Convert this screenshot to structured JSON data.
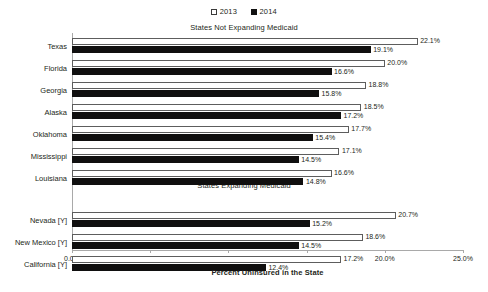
{
  "legend": {
    "position": "top-center",
    "entries": [
      {
        "label": "2013",
        "style": "open",
        "color": "#ffffff"
      },
      {
        "label": "2014",
        "style": "filled",
        "color": "#111111"
      }
    ]
  },
  "sections": [
    {
      "id": "not-expanding",
      "title": "States Not Expanding Medicaid"
    },
    {
      "id": "expanding",
      "title": "States Expanding Medicaid"
    }
  ],
  "axis": {
    "xlabel": "Percent Uninsured in the State",
    "ticks": [
      "0.0%",
      "5.0%",
      "10.0%",
      "15.0%",
      "20.0%",
      "25.0%"
    ],
    "tick_values": [
      0,
      5,
      10,
      15,
      20,
      25
    ],
    "xmin": 0,
    "xmax": 25
  },
  "chart_data": {
    "type": "bar",
    "orientation": "horizontal",
    "title": "",
    "subtitle": "",
    "xlabel": "Percent Uninsured in the State",
    "ylabel": "",
    "xlim": [
      0,
      25
    ],
    "grid": false,
    "legend_position": "top-center",
    "tick_labels": [
      "0.0%",
      "5.0%",
      "10.0%",
      "15.0%",
      "20.0%",
      "25.0%"
    ],
    "groups": [
      {
        "name": "States Not Expanding Medicaid",
        "categories": [
          "Texas",
          "Florida",
          "Georgia",
          "Alaska",
          "Oklahoma",
          "Mississippi",
          "Louisiana"
        ],
        "series": [
          {
            "name": "2013",
            "values": [
              22.1,
              20.0,
              18.8,
              18.5,
              17.7,
              17.1,
              16.6
            ],
            "labels": [
              "22.1%",
              "20.0%",
              "18.8%",
              "18.5%",
              "17.7%",
              "17.1%",
              "16.6%"
            ]
          },
          {
            "name": "2014",
            "values": [
              19.1,
              16.6,
              15.8,
              17.2,
              15.4,
              14.5,
              14.8
            ],
            "labels": [
              "19.1%",
              "16.6%",
              "15.8%",
              "17.2%",
              "15.4%",
              "14.5%",
              "14.8%"
            ]
          }
        ]
      },
      {
        "name": "States Expanding Medicaid",
        "categories": [
          "Nevada [Y]",
          "New Mexico [Y]",
          "California [Y]"
        ],
        "series": [
          {
            "name": "2013",
            "values": [
              20.7,
              18.6,
              17.2
            ],
            "labels": [
              "20.7%",
              "18.6%",
              "17.2%"
            ]
          },
          {
            "name": "2014",
            "values": [
              15.2,
              14.5,
              12.4
            ],
            "labels": [
              "15.2%",
              "14.5%",
              "12.4%"
            ]
          }
        ]
      }
    ]
  },
  "colors": {
    "series_2013": "#ffffff",
    "series_2013_outline": "#5d5d5d",
    "series_2014": "#100f0f",
    "axis": "#a9a9a9",
    "text": "#231f20",
    "background": "#ffffff"
  }
}
